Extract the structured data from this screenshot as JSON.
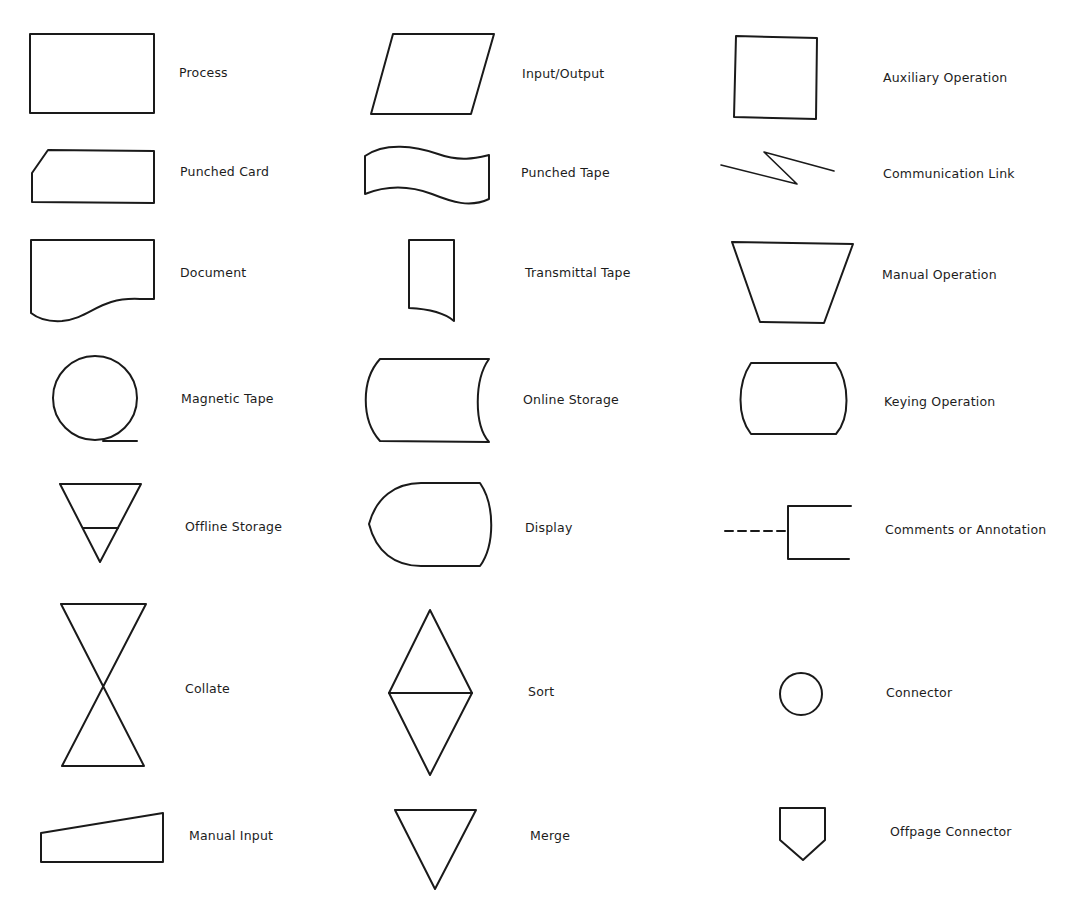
{
  "diagram": {
    "type": "flowchart-symbol-legend",
    "columns": 3,
    "stroke_color": "#1a1a1a",
    "background_color": "#ffffff",
    "symbols": [
      {
        "id": "process",
        "label": "Process",
        "column": 1,
        "row": 1
      },
      {
        "id": "input-output",
        "label": "Input/Output",
        "column": 2,
        "row": 1
      },
      {
        "id": "auxiliary-operation",
        "label": "Auxiliary Operation",
        "column": 3,
        "row": 1
      },
      {
        "id": "punched-card",
        "label": "Punched Card",
        "column": 1,
        "row": 2
      },
      {
        "id": "punched-tape",
        "label": "Punched Tape",
        "column": 2,
        "row": 2
      },
      {
        "id": "communication-link",
        "label": "Communication Link",
        "column": 3,
        "row": 2
      },
      {
        "id": "document",
        "label": "Document",
        "column": 1,
        "row": 3
      },
      {
        "id": "transmittal-tape",
        "label": "Transmittal Tape",
        "column": 2,
        "row": 3
      },
      {
        "id": "manual-operation",
        "label": "Manual Operation",
        "column": 3,
        "row": 3
      },
      {
        "id": "magnetic-tape",
        "label": "Magnetic Tape",
        "column": 1,
        "row": 4
      },
      {
        "id": "online-storage",
        "label": "Online Storage",
        "column": 2,
        "row": 4
      },
      {
        "id": "keying-operation",
        "label": "Keying Operation",
        "column": 3,
        "row": 4
      },
      {
        "id": "offline-storage",
        "label": "Offline Storage",
        "column": 1,
        "row": 5
      },
      {
        "id": "display",
        "label": "Display",
        "column": 2,
        "row": 5
      },
      {
        "id": "comments-annotation",
        "label": "Comments or Annotation",
        "column": 3,
        "row": 5
      },
      {
        "id": "collate",
        "label": "Collate",
        "column": 1,
        "row": 6
      },
      {
        "id": "sort",
        "label": "Sort",
        "column": 2,
        "row": 6
      },
      {
        "id": "connector",
        "label": "Connector",
        "column": 3,
        "row": 6
      },
      {
        "id": "manual-input",
        "label": "Manual Input",
        "column": 1,
        "row": 7
      },
      {
        "id": "merge",
        "label": "Merge",
        "column": 2,
        "row": 7
      },
      {
        "id": "offpage-connector",
        "label": "Offpage Connector",
        "column": 3,
        "row": 7
      }
    ]
  }
}
